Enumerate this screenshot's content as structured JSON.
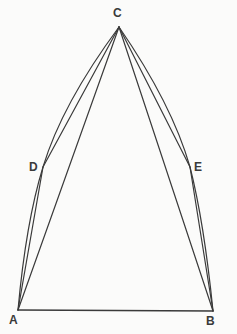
{
  "figure": {
    "canvas": {
      "width": 237,
      "height": 334
    },
    "background_color": "#fbfbfa",
    "stroke_color": "#3a3a3a",
    "label_color": "#3a3a3a",
    "stroke_width": 1.2
  },
  "points": {
    "A": {
      "label": "A",
      "x": 18,
      "y": 310,
      "label_x": 9,
      "label_y": 316
    },
    "B": {
      "label": "B",
      "x": 213,
      "y": 311,
      "label_x": 207,
      "label_y": 317
    },
    "C": {
      "label": "C",
      "x": 119,
      "y": 27,
      "label_x": 113,
      "label_y": 7
    },
    "D": {
      "label": "D",
      "x": 43,
      "y": 167,
      "label_x": 29,
      "label_y": 161
    },
    "E": {
      "label": "E",
      "x": 190,
      "y": 167,
      "label_x": 194,
      "label_y": 161
    }
  },
  "segments": [
    {
      "name": "base-ab",
      "from": "A",
      "to": "B"
    },
    {
      "name": "chord-ac",
      "from": "A",
      "to": "C"
    },
    {
      "name": "chord-bc",
      "from": "B",
      "to": "C"
    },
    {
      "name": "chord-dc",
      "from": "D",
      "to": "C"
    },
    {
      "name": "chord-ec",
      "from": "E",
      "to": "C"
    },
    {
      "name": "segment-ad",
      "from": "A",
      "to": "D"
    },
    {
      "name": "segment-be",
      "from": "B",
      "to": "E"
    }
  ],
  "arcs": [
    {
      "name": "arc-a-d-c",
      "from": "A",
      "via": "D",
      "to": "C",
      "control_x": 29,
      "control_y": 96
    },
    {
      "name": "arc-b-e-c",
      "from": "B",
      "via": "E",
      "to": "C",
      "control_x": 205,
      "control_y": 96
    }
  ],
  "label_list": [
    "C",
    "D",
    "E",
    "A",
    "B"
  ]
}
